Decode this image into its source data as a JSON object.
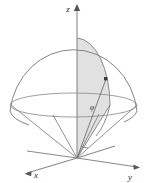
{
  "figure": {
    "type": "3d-geometry-diagram",
    "background_color": "#ffffff",
    "shaded_region_color": "#e1e1e1",
    "outline_color": "#777777",
    "axis_color": "#8a8a8a",
    "label_color": "#2b2b2b"
  },
  "axes": {
    "z": {
      "label": "z",
      "icon": "arrow-up-icon",
      "label_x": 70,
      "label_y": 10,
      "tip_x": 77,
      "tip_y": 5,
      "origin_x": 77,
      "origin_y": 158
    },
    "x": {
      "label": "x",
      "icon": "arrow-left-icon",
      "label_x": 33,
      "label_y": 178,
      "tip_x": 28,
      "tip_y": 172,
      "origin_x": 77,
      "origin_y": 158
    },
    "y": {
      "label": "y",
      "icon": "arrow-right-icon",
      "label_x": 128,
      "label_y": 180,
      "tip_x": 138,
      "tip_y": 167,
      "origin_x": 77,
      "origin_y": 158
    }
  },
  "sphere": {
    "center_x": 73,
    "center_y": 105,
    "radius_x": 64,
    "radius_y": 67,
    "equator_ry": 12,
    "top_x": 77,
    "top_y": 38
  },
  "cone": {
    "apex_x": 77,
    "apex_y": 158,
    "left_rim_x": 11,
    "left_rim_y": 106,
    "right_rim_x": 137,
    "right_rim_y": 106
  },
  "point": {
    "label": "",
    "marker": "filled-square-dot",
    "x": 106,
    "y": 79
  },
  "angle": {
    "label": "φ",
    "label_x": 92,
    "label_y": 109,
    "arc_radius": 10
  },
  "legend": {
    "shaded_meaning": "meridian cross-section wedge",
    "solid_meaning": "spherical cap bounded below by cone"
  }
}
